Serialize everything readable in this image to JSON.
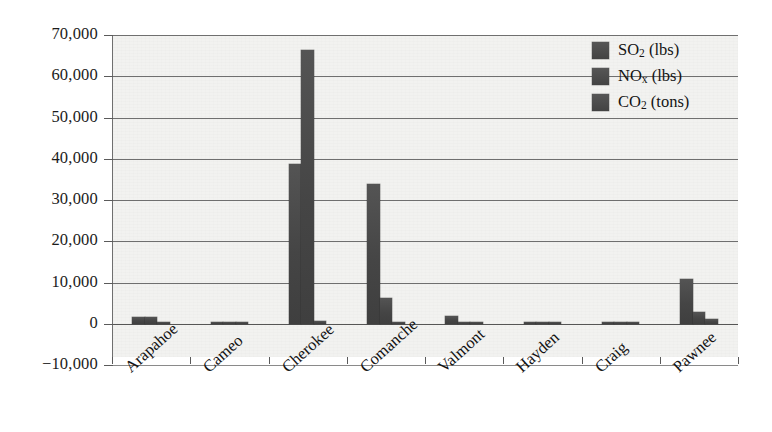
{
  "chart_data": {
    "type": "bar",
    "title": "",
    "xlabel": "",
    "ylabel": "",
    "ylim": [
      -10000,
      70000
    ],
    "ytick_step": 10000,
    "grid": "horizontal",
    "legend_position": "top-right-inside",
    "orientation": "vertical-grouped",
    "bar_color": "#4a4a4a",
    "plot_background": "#f2f2f0",
    "axis_color": "#6f6f6f",
    "categories": [
      "Arapahoe",
      "Cameo",
      "Cherokee",
      "Comanche",
      "Valmont",
      "Hayden",
      "Craig",
      "Pawnee"
    ],
    "ytick_labels": [
      "70,000",
      "60,000",
      "50,000",
      "40,000",
      "30,000",
      "20,000",
      "10,000",
      "0",
      "−10,000"
    ],
    "ytick_values": [
      70000,
      60000,
      50000,
      40000,
      30000,
      20000,
      10000,
      0,
      -10000
    ],
    "series": [
      {
        "name": "SO2 (lbs)",
        "label_main": "SO",
        "label_sub": "2",
        "label_unit": " (lbs)",
        "values": [
          1700,
          120,
          38700,
          34000,
          2000,
          300,
          220,
          10800
        ]
      },
      {
        "name": "NOx (lbs)",
        "label_main": "NO",
        "label_sub": "x",
        "label_unit": " (lbs)",
        "values": [
          1600,
          200,
          66300,
          6200,
          120,
          420,
          300,
          3000
        ]
      },
      {
        "name": "CO2 (tons)",
        "label_main": "CO",
        "label_sub": "2",
        "label_unit": " (tons)",
        "values": [
          220,
          60,
          700,
          600,
          110,
          160,
          150,
          1100
        ]
      }
    ]
  }
}
